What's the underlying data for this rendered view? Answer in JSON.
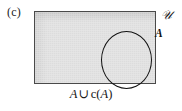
{
  "figure": {
    "part_label": "(c)",
    "caption_set_a": "A",
    "caption_union": "∪",
    "caption_complement_fn": "c",
    "caption_open_paren": "(",
    "caption_close_paren": ")",
    "caption_inner_set": "A",
    "caption_full": "A ∪ c(A)",
    "universe_symbol": "𝒰",
    "region_label_a": "A",
    "colors": {
      "shaded_region": "#dcdcdc",
      "rectangle_border": "#4a4a4a",
      "circle_border": "#111111",
      "text": "#151515",
      "background": "#ffffff"
    }
  }
}
